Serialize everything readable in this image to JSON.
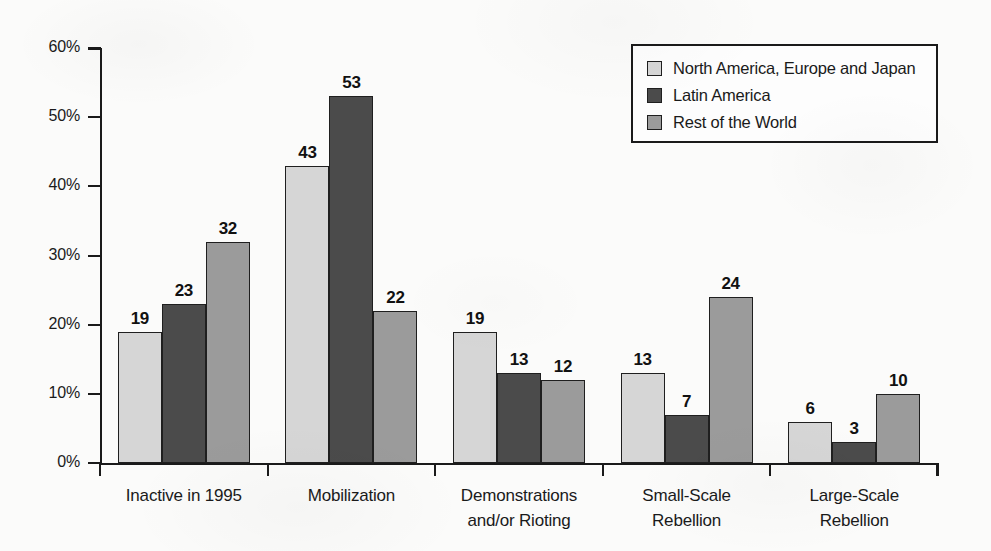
{
  "chart_data": {
    "type": "bar",
    "title": "",
    "xlabel": "",
    "ylabel": "",
    "ylim": [
      0,
      60
    ],
    "ytick_values": [
      0,
      10,
      20,
      30,
      40,
      50,
      60
    ],
    "ytick_labels": [
      "0%",
      "10%",
      "20%",
      "30%",
      "40%",
      "50%",
      "60%"
    ],
    "grid": false,
    "legend_position": "top-right",
    "categories": [
      "Inactive in 1995",
      "Mobilization",
      "Demonstrations and/or Rioting",
      "Small-Scale Rebellion",
      "Large-Scale Rebellion"
    ],
    "category_lines": [
      [
        "Inactive in 1995"
      ],
      [
        "Mobilization"
      ],
      [
        "Demonstrations",
        "and/or Rioting"
      ],
      [
        "Small-Scale",
        "Rebellion"
      ],
      [
        "Large-Scale",
        "Rebellion"
      ]
    ],
    "series": [
      {
        "name": "North America, Europe and Japan",
        "color": "#d6d6d6",
        "values": [
          19,
          43,
          19,
          13,
          6
        ],
        "labels": [
          "19",
          "43",
          "19",
          "13",
          "6"
        ]
      },
      {
        "name": "Latin America",
        "color": "#4b4b4b",
        "values": [
          23,
          53,
          13,
          7,
          3
        ],
        "labels": [
          "23",
          "53",
          "13",
          "7",
          "3"
        ]
      },
      {
        "name": "Rest of the World",
        "color": "#9b9b9b",
        "values": [
          32,
          22,
          12,
          24,
          10
        ],
        "labels": [
          "32",
          "22",
          "12",
          "24",
          "10"
        ]
      }
    ]
  },
  "legend": {
    "items": [
      {
        "label": "North America, Europe and Japan",
        "color": "#d6d6d6"
      },
      {
        "label": "Latin America",
        "color": "#4b4b4b"
      },
      {
        "label": "Rest of the World",
        "color": "#9b9b9b"
      }
    ]
  },
  "colors": {
    "axis": "#1a1a1a",
    "text": "#1a1a1a",
    "background": "#fbfbfa",
    "bar_border": "#1f1f1f"
  }
}
